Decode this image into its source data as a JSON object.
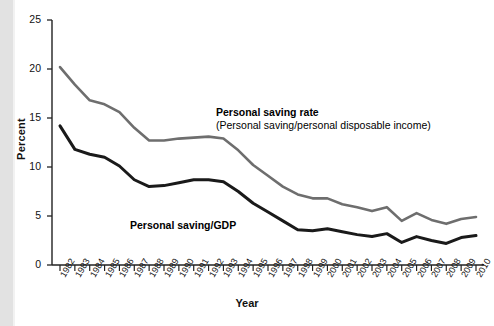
{
  "chart_data": {
    "type": "line",
    "title": "",
    "xlabel": "Year",
    "ylabel": "Percent",
    "ylim": [
      0,
      25
    ],
    "yticks": [
      0,
      5,
      10,
      15,
      20,
      25
    ],
    "grid": false,
    "legend_position": "inline-annotation",
    "categories": [
      "1982",
      "1983",
      "1984",
      "1985",
      "1986",
      "1987",
      "1988",
      "1989",
      "1990",
      "1991",
      "1992",
      "1993",
      "1994",
      "1995",
      "1996",
      "1997",
      "1998",
      "1999",
      "2000",
      "2001",
      "2002",
      "2003",
      "2004",
      "2005",
      "2006",
      "2007",
      "2008",
      "2009",
      "2010"
    ],
    "series": [
      {
        "name": "Personal saving rate",
        "description": "Personal saving/personal disposable income",
        "color": "#6e6e6e",
        "values": [
          20.2,
          18.4,
          16.8,
          16.4,
          15.6,
          14.0,
          12.7,
          12.7,
          12.9,
          13.0,
          13.1,
          12.9,
          11.7,
          10.2,
          9.1,
          8.0,
          7.2,
          6.8,
          6.8,
          6.2,
          5.9,
          5.5,
          5.9,
          4.5,
          5.3,
          4.6,
          4.2,
          4.7,
          4.9
        ]
      },
      {
        "name": "Personal saving/GDP",
        "description": "",
        "color": "#1a1a1a",
        "values": [
          14.2,
          11.8,
          11.3,
          11.0,
          10.1,
          8.7,
          8.0,
          8.1,
          8.4,
          8.7,
          8.7,
          8.5,
          7.5,
          6.3,
          5.4,
          4.5,
          3.6,
          3.5,
          3.7,
          3.4,
          3.1,
          2.9,
          3.2,
          2.3,
          2.9,
          2.5,
          2.2,
          2.8,
          3.0
        ]
      }
    ]
  },
  "annotations": {
    "rate_heading": "Personal saving rate",
    "rate_subtext": "(Personal saving/personal disposable income)",
    "gdp_label": "Personal saving/GDP"
  },
  "axis": {
    "y_title": "Percent",
    "x_title": "Year"
  },
  "colors": {
    "saving_rate_line": "#6e6e6e",
    "saving_gdp_line": "#1a1a1a",
    "axis": "#222222",
    "background": "#ffffff",
    "left_band": "#e2e2e2"
  }
}
